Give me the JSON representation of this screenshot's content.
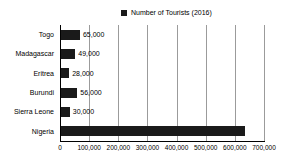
{
  "chart_data": {
    "type": "bar",
    "orientation": "horizontal",
    "legend": "Number of Tourists (2016)",
    "categories": [
      "Togo",
      "Madagascar",
      "Eritrea",
      "Burundi",
      "Sierra Leone",
      "Nigeria"
    ],
    "values": [
      65000,
      49000,
      28000,
      56000,
      30000,
      630000
    ],
    "value_labels": [
      "65,000",
      "49,000",
      "28,000",
      "56,000",
      "30,000",
      ""
    ],
    "x_ticks": [
      "0",
      "100,000",
      "200,000",
      "300,000",
      "400,000",
      "500,000",
      "600,000",
      "700,000"
    ],
    "xlim": [
      0,
      700000
    ],
    "grid": true,
    "legend_position": "top-center"
  },
  "colors": {
    "bar": "#1a1a1a",
    "grid": "#9b9b9b",
    "axis": "#000000",
    "text": "#000000",
    "background": "#ffffff"
  }
}
